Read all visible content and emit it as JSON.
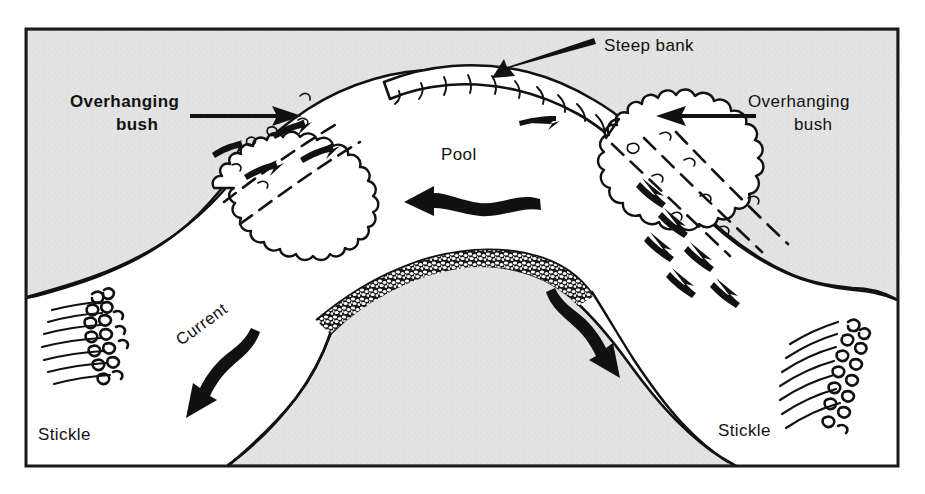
{
  "figure": {
    "frame_color": "#1a1a1a",
    "land_fill": "#e2e2e2",
    "water_fill": "#ffffff",
    "ink_color": "#111111",
    "page_background": "#ffffff"
  },
  "labels": {
    "steep_bank": "Steep bank",
    "overhanging_bush_left_line1": "Overhanging",
    "overhanging_bush_left_line2": "bush",
    "overhanging_bush_right_line1": "Overhanging",
    "overhanging_bush_right_line2": "bush",
    "pool": "Pool",
    "current": "Current",
    "stickle_left": "Stickle",
    "stickle_right": "Stickle"
  },
  "features": {
    "pool_flow_direction": "left",
    "current_flow_direction": "down-left",
    "right_channel_flow_direction": "up-left",
    "left_bush_fish_count": 4,
    "right_bush_fish_count": 6,
    "bank_flow_arrow_count": 2
  }
}
